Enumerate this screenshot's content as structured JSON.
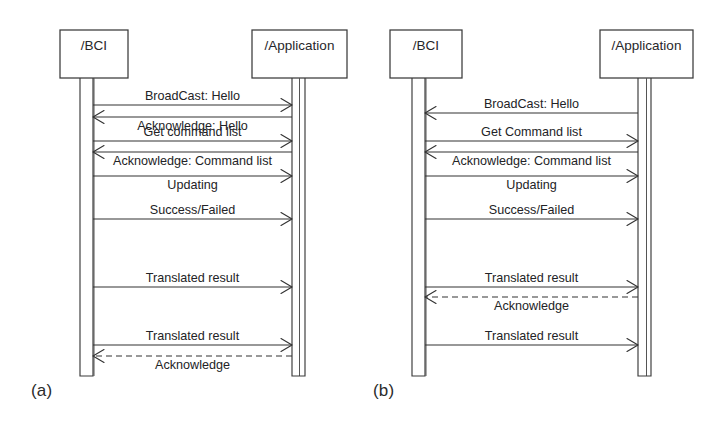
{
  "figure": {
    "kind": "uml-sequence-diagram",
    "background_color": "#ffffff",
    "line_color": "#333333",
    "text_color": "#232326",
    "panels": [
      {
        "id": "a",
        "caption": "(a)",
        "lifelines": [
          {
            "id": "bci",
            "title": "/BCI",
            "box": {
              "x": 60,
              "y": 30,
              "w": 68,
              "h": 48
            },
            "activation": {
              "x": 80,
              "w": 13,
              "top": 78,
              "bottom": 376
            }
          },
          {
            "id": "application",
            "title": "/Application",
            "box": {
              "x": 252,
              "y": 30,
              "w": 95,
              "h": 48
            },
            "activation": {
              "x": 292,
              "w": 13,
              "top": 78,
              "bottom": 376
            }
          }
        ],
        "messages": [
          {
            "index": 1,
            "label": "BroadCast: Hello",
            "from": "bci",
            "to": "application",
            "direction": "right",
            "style": "solid",
            "y": 105,
            "label_position": "above"
          },
          {
            "index": 2,
            "label": "Acknowledge: Hello",
            "from": "application",
            "to": "bci",
            "direction": "left",
            "style": "solid",
            "y": 117,
            "label_position": "below"
          },
          {
            "index": 3,
            "label": "Get command list",
            "from": "bci",
            "to": "application",
            "direction": "right",
            "style": "solid",
            "y": 141,
            "label_position": "above"
          },
          {
            "index": 4,
            "label": "Acknowledge: Command list",
            "from": "application",
            "to": "bci",
            "direction": "left",
            "style": "solid",
            "y": 152,
            "label_position": "below"
          },
          {
            "index": 5,
            "label": "Updating",
            "from": "bci",
            "to": "application",
            "direction": "right",
            "style": "solid",
            "y": 176,
            "label_position": "below"
          },
          {
            "index": 6,
            "label": "Success/Failed",
            "from": "bci",
            "to": "application",
            "direction": "right",
            "style": "solid",
            "y": 219,
            "label_position": "above"
          },
          {
            "index": 7,
            "label": "Translated result",
            "from": "bci",
            "to": "application",
            "direction": "right",
            "style": "solid",
            "y": 287,
            "label_position": "above"
          },
          {
            "index": 8,
            "label": "Translated result",
            "from": "bci",
            "to": "application",
            "direction": "right",
            "style": "solid",
            "y": 345,
            "label_position": "above"
          },
          {
            "index": 9,
            "label": "Acknowledge",
            "from": "application",
            "to": "bci",
            "direction": "left",
            "style": "dashed",
            "y": 356,
            "label_position": "below"
          }
        ]
      },
      {
        "id": "b",
        "caption": "(b)",
        "lifelines": [
          {
            "id": "bci",
            "title": "/BCI",
            "box": {
              "x": 390,
              "y": 30,
              "w": 72,
              "h": 48
            },
            "activation": {
              "x": 412,
              "w": 13,
              "top": 78,
              "bottom": 376
            }
          },
          {
            "id": "application",
            "title": "/Application",
            "box": {
              "x": 600,
              "y": 30,
              "w": 93,
              "h": 48
            },
            "activation": {
              "x": 638,
              "w": 13,
              "top": 78,
              "bottom": 376
            }
          }
        ],
        "messages": [
          {
            "index": 1,
            "label": "BroadCast: Hello",
            "from": "application",
            "to": "bci",
            "direction": "left",
            "style": "solid",
            "y": 113,
            "label_position": "above"
          },
          {
            "index": 2,
            "label": "Get Command list",
            "from": "bci",
            "to": "application",
            "direction": "right",
            "style": "solid",
            "y": 141,
            "label_position": "above"
          },
          {
            "index": 3,
            "label": "Acknowledge: Command list",
            "from": "application",
            "to": "bci",
            "direction": "left",
            "style": "solid",
            "y": 152,
            "label_position": "below"
          },
          {
            "index": 4,
            "label": "Updating",
            "from": "bci",
            "to": "application",
            "direction": "right",
            "style": "solid",
            "y": 176,
            "label_position": "below"
          },
          {
            "index": 5,
            "label": "Success/Failed",
            "from": "bci",
            "to": "application",
            "direction": "right",
            "style": "solid",
            "y": 219,
            "label_position": "above"
          },
          {
            "index": 6,
            "label": "Translated result",
            "from": "bci",
            "to": "application",
            "direction": "right",
            "style": "solid",
            "y": 287,
            "label_position": "above"
          },
          {
            "index": 7,
            "label": "Acknowledge",
            "from": "application",
            "to": "bci",
            "direction": "left",
            "style": "dashed",
            "y": 297,
            "label_position": "below"
          },
          {
            "index": 8,
            "label": "Translated result",
            "from": "bci",
            "to": "application",
            "direction": "right",
            "style": "solid",
            "y": 345,
            "label_position": "above"
          }
        ]
      }
    ]
  }
}
